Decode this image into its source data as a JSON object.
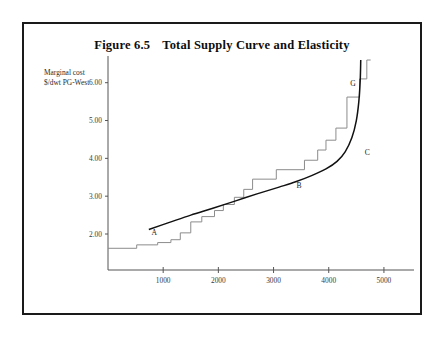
{
  "figure": {
    "title_number": "Figure 6.5",
    "title_text": "Total Supply Curve and Elasticity",
    "axis_caption": "Marginal cost\n$/dwt PG-West"
  },
  "chart_data": {
    "type": "line",
    "xlabel": "",
    "ylabel": "Marginal cost $/dwt PG-West",
    "xlim": [
      0,
      5400
    ],
    "ylim": [
      1.3,
      6.6
    ],
    "grid": false,
    "legend": "none",
    "xticks": [
      1000,
      2000,
      3000,
      4000,
      5000
    ],
    "xtick_labels": [
      "1000",
      "2000",
      "3000",
      "4000",
      "5000"
    ],
    "yticks": [
      2.0,
      3.0,
      4.0,
      5.0,
      6.0
    ],
    "ytick_labels": [
      "2.00",
      "3.00",
      "4.00",
      "5.00",
      "6.00"
    ],
    "series": [
      {
        "name": "step-supply-schedule",
        "style": "step",
        "color": "#8c8c8c",
        "points": [
          [
            0,
            1.5
          ],
          [
            520,
            1.5
          ],
          [
            520,
            1.62
          ],
          [
            900,
            1.62
          ],
          [
            900,
            1.7
          ],
          [
            1140,
            1.7
          ],
          [
            1140,
            1.8
          ],
          [
            1310,
            1.8
          ],
          [
            1310,
            2.03
          ],
          [
            1500,
            2.03
          ],
          [
            1500,
            2.32
          ],
          [
            1700,
            2.32
          ],
          [
            1700,
            2.46
          ],
          [
            1930,
            2.46
          ],
          [
            1930,
            2.62
          ],
          [
            2090,
            2.62
          ],
          [
            2090,
            2.78
          ],
          [
            2290,
            2.78
          ],
          [
            2290,
            2.97
          ],
          [
            2460,
            2.97
          ],
          [
            2460,
            3.18
          ],
          [
            2620,
            3.18
          ],
          [
            2620,
            3.45
          ],
          [
            3050,
            3.45
          ],
          [
            3050,
            3.7
          ],
          [
            3560,
            3.7
          ],
          [
            3560,
            3.95
          ],
          [
            3800,
            3.95
          ],
          [
            3800,
            4.22
          ],
          [
            3950,
            4.22
          ],
          [
            3950,
            4.48
          ],
          [
            4130,
            4.48
          ],
          [
            4130,
            4.8
          ],
          [
            4330,
            4.8
          ],
          [
            4330,
            5.62
          ],
          [
            4560,
            5.62
          ],
          [
            4560,
            6.1
          ],
          [
            4690,
            6.1
          ],
          [
            4690,
            6.6
          ],
          [
            4760,
            6.6
          ]
        ]
      },
      {
        "name": "smooth-supply-curve",
        "style": "curve",
        "color": "#111111",
        "points": [
          [
            740,
            2.12
          ],
          [
            1100,
            2.3
          ],
          [
            1500,
            2.5
          ],
          [
            1900,
            2.68
          ],
          [
            2300,
            2.87
          ],
          [
            2700,
            3.06
          ],
          [
            3100,
            3.24
          ],
          [
            3400,
            3.38
          ],
          [
            3700,
            3.55
          ],
          [
            3950,
            3.72
          ],
          [
            4150,
            3.92
          ],
          [
            4300,
            4.18
          ],
          [
            4420,
            4.55
          ],
          [
            4500,
            5.0
          ],
          [
            4545,
            5.5
          ],
          [
            4570,
            6.05
          ],
          [
            4580,
            6.6
          ]
        ]
      }
    ],
    "annotations": [
      {
        "label": "A",
        "x": 840,
        "y": 1.97,
        "note": "lower end of elastic segment"
      },
      {
        "label": "B",
        "x": 3460,
        "y": 3.22,
        "note": "mid elastic segment"
      },
      {
        "label": "C",
        "x": 4700,
        "y": 4.1,
        "note": "knee of curve / inelastic onset"
      },
      {
        "label": "G",
        "x": 4440,
        "y": 5.92,
        "note": "near-vertical capacity limit"
      }
    ]
  }
}
